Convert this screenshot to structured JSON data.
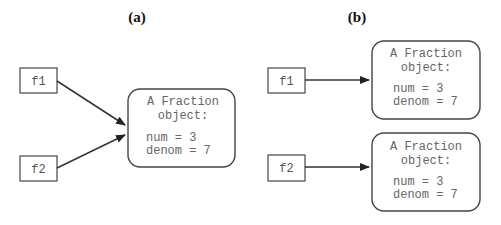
{
  "panels": [
    {
      "label": "(a)",
      "variables": [
        {
          "name": "f1"
        },
        {
          "name": "f2"
        }
      ],
      "objects": [
        {
          "title_line1": "A Fraction",
          "title_line2": "object:",
          "num": "num = 3",
          "denom": "denom = 7"
        }
      ]
    },
    {
      "label": "(b)",
      "variables": [
        {
          "name": "f1"
        },
        {
          "name": "f2"
        }
      ],
      "objects": [
        {
          "title_line1": "A Fraction",
          "title_line2": "object:",
          "num": "num = 3",
          "denom": "denom = 7"
        },
        {
          "title_line1": "A Fraction",
          "title_line2": "object:",
          "num": "num = 3",
          "denom": "denom = 7"
        }
      ]
    }
  ]
}
